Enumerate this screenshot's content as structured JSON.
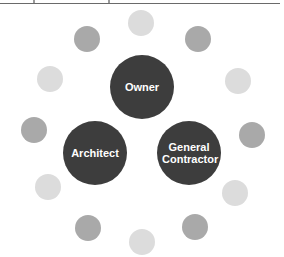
{
  "colors": {
    "primary_circle": "#3d3d3d",
    "medium_circle": "#a9a9a9",
    "light_circle": "#dcdcdc",
    "label_text": "#ffffff",
    "background": "#ffffff"
  },
  "main_nodes": [
    {
      "id": "owner",
      "label": "Owner",
      "cx": 142,
      "cy": 87
    },
    {
      "id": "architect",
      "label": "Architect",
      "cx": 95,
      "cy": 153
    },
    {
      "id": "general-contractor",
      "label": "General Contractor",
      "cx": 189,
      "cy": 153
    }
  ],
  "outer_dots": [
    {
      "cx": 141,
      "cy": 23,
      "tone": "light"
    },
    {
      "cx": 198,
      "cy": 39,
      "tone": "medium"
    },
    {
      "cx": 238,
      "cy": 81,
      "tone": "light"
    },
    {
      "cx": 252,
      "cy": 135,
      "tone": "medium"
    },
    {
      "cx": 235,
      "cy": 193,
      "tone": "light"
    },
    {
      "cx": 195,
      "cy": 227,
      "tone": "medium"
    },
    {
      "cx": 142,
      "cy": 242,
      "tone": "light"
    },
    {
      "cx": 88,
      "cy": 228,
      "tone": "medium"
    },
    {
      "cx": 48,
      "cy": 187,
      "tone": "light"
    },
    {
      "cx": 34,
      "cy": 130,
      "tone": "medium"
    },
    {
      "cx": 50,
      "cy": 79,
      "tone": "light"
    },
    {
      "cx": 87,
      "cy": 39,
      "tone": "medium"
    }
  ]
}
